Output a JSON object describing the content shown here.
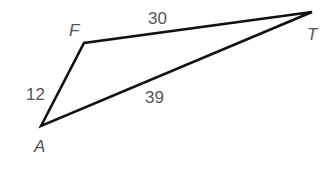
{
  "diagram": {
    "type": "triangle",
    "vertices": {
      "A": {
        "label": "A",
        "x": 41,
        "y": 126
      },
      "F": {
        "label": "F",
        "x": 84,
        "y": 43
      },
      "T": {
        "label": "T",
        "x": 312,
        "y": 12
      }
    },
    "sides": {
      "AF": {
        "label": "12"
      },
      "FT": {
        "label": "30"
      },
      "AT": {
        "label": "39"
      }
    }
  }
}
